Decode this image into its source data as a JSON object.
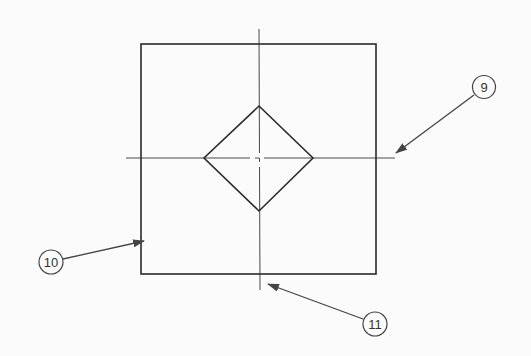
{
  "diagram": {
    "type": "technical-drawing",
    "colors": {
      "line": "#2a2a2a",
      "background": "#fbfbfb",
      "leader": "#444444"
    },
    "callouts": [
      {
        "id": "9",
        "label": "9",
        "target": "horizontal-centerline-end"
      },
      {
        "id": "10",
        "label": "10",
        "target": "outer-square-edge"
      },
      {
        "id": "11",
        "label": "11",
        "target": "vertical-centerline-end"
      }
    ]
  }
}
